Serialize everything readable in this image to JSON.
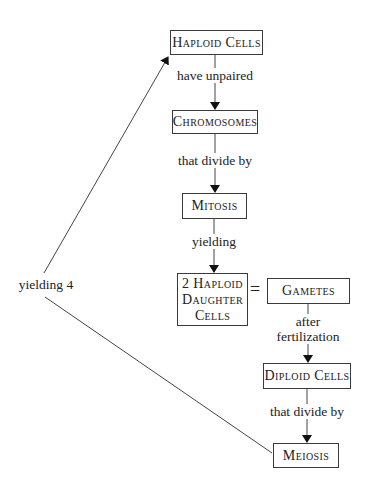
{
  "diagram": {
    "type": "concept-map",
    "nodes": {
      "haploid_cells": "Haploid Cells",
      "chromosomes": "Chromosomes",
      "mitosis": "Mitosis",
      "daughter_cells_line1": "2 Haploid",
      "daughter_cells_line2": "Daughter",
      "daughter_cells_line3": "Cells",
      "gametes": "Gametes",
      "diploid_cells": "Diploid Cells",
      "meiosis": "Meiosis"
    },
    "edges": {
      "haploid_to_chromosomes": "have unpaired",
      "chromosomes_to_mitosis": "that divide by",
      "mitosis_to_daughter": "yielding",
      "gametes_to_diploid_line1": "after",
      "gametes_to_diploid_line2": "fertilization",
      "diploid_to_meiosis": "that divide by",
      "meiosis_to_haploid": "yielding 4"
    },
    "equals": "="
  }
}
